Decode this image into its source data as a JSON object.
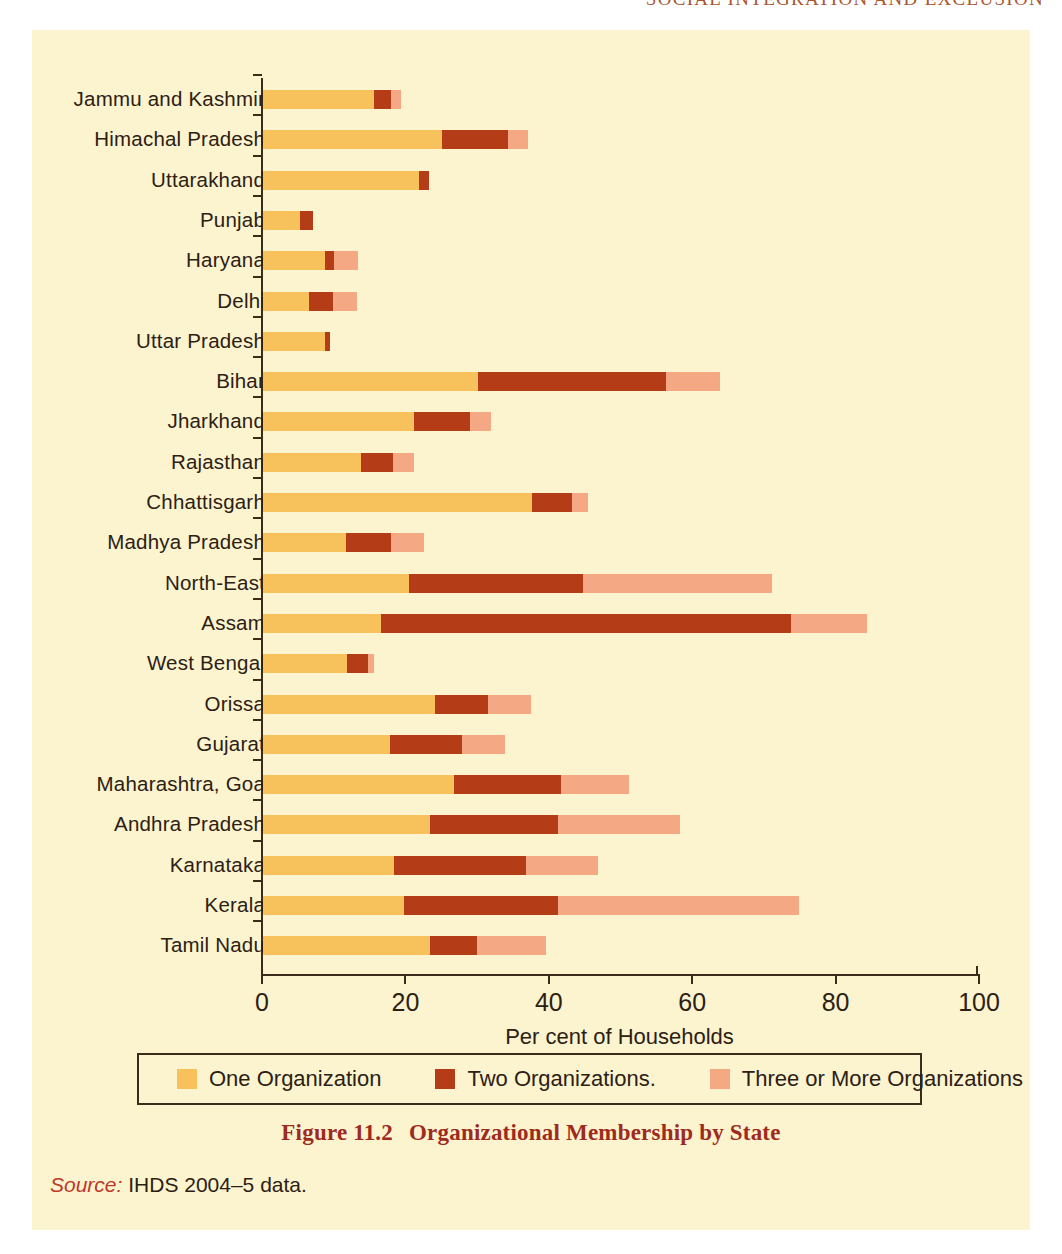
{
  "page": {
    "running_head": "SOCIAL INTEGRATION AND EXCLUSION"
  },
  "caption": {
    "number": "Figure 11.2",
    "title": "Organizational Membership by State"
  },
  "source": {
    "lead": "Source:",
    "text": " IHDS 2004–5 data."
  },
  "legend": {
    "items": [
      {
        "label": "One Organization",
        "color": "#f7c25b"
      },
      {
        "label": "Two Organizations.",
        "color": "#b43c16"
      },
      {
        "label": "Three or More Organizations",
        "color": "#f4a883"
      }
    ]
  },
  "chart_data": {
    "type": "bar",
    "orientation": "horizontal",
    "stacked": true,
    "title": "Organizational Membership by State",
    "xlabel": "Per cent of Households",
    "ylabel": "",
    "xlim": [
      0,
      100
    ],
    "xticks": [
      0,
      20,
      40,
      60,
      80,
      100
    ],
    "grid": false,
    "legend_position": "bottom",
    "categories": [
      "Jammu and Kashmir",
      "Himachal Pradesh",
      "Uttarakhand",
      "Punjab",
      "Haryana",
      "Delhi",
      "Uttar Pradesh",
      "Bihar",
      "Jharkhand",
      "Rajasthan",
      "Chhattisgarh",
      "Madhya Pradesh",
      "North-East",
      "Assam",
      "West Bengal",
      "Orissa",
      "Gujarat",
      "Maharashtra, Goa",
      "Andhra Pradesh",
      "Karnataka",
      "Kerala",
      "Tamil Nadu"
    ],
    "series": [
      {
        "name": "One Organization",
        "color": "#f7c25b",
        "values": [
          15.5,
          25.0,
          21.8,
          5.2,
          8.6,
          6.4,
          8.7,
          30.0,
          21.0,
          13.6,
          37.5,
          11.6,
          20.3,
          16.4,
          11.7,
          24.0,
          17.7,
          26.6,
          23.3,
          18.3,
          19.7,
          23.3
        ]
      },
      {
        "name": "Two Organizations.",
        "color": "#b43c16",
        "values": [
          2.3,
          9.2,
          1.3,
          1.8,
          1.3,
          3.3,
          0.7,
          26.2,
          7.9,
          4.6,
          5.6,
          6.2,
          24.4,
          57.3,
          3.0,
          7.4,
          10.1,
          14.9,
          17.8,
          18.4,
          21.5,
          6.5
        ]
      },
      {
        "name": "Three or More Organizations",
        "color": "#f4a883",
        "values": [
          1.4,
          2.8,
          0.0,
          0.0,
          3.4,
          3.4,
          0.0,
          7.6,
          2.9,
          2.9,
          2.2,
          4.6,
          26.3,
          10.6,
          0.8,
          6.0,
          5.9,
          9.6,
          17.1,
          10.0,
          33.5,
          9.7
        ]
      }
    ],
    "totals": [
      19.2,
      37.0,
      23.1,
      7.0,
      13.3,
      13.1,
      9.4,
      63.8,
      31.8,
      21.1,
      45.3,
      22.4,
      71.0,
      84.3,
      15.5,
      37.4,
      33.7,
      51.1,
      58.2,
      46.7,
      74.7,
      39.5
    ]
  }
}
